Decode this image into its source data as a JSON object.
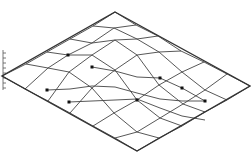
{
  "figure": {
    "kind": "wireframe-surface",
    "colors": {
      "background": "#ffffff",
      "edge": "#333333",
      "mesh": "#444444",
      "marker": "#111111",
      "axis": "#555555"
    }
  },
  "outline": {
    "top": [
      115,
      12
    ],
    "right": [
      250,
      86
    ],
    "bottom": [
      137,
      151
    ],
    "left": [
      2,
      76
    ]
  },
  "axis": {
    "x": 3,
    "y_top": 50,
    "y_bottom": 90,
    "ticks": [
      53,
      58,
      63,
      68,
      73,
      78,
      83,
      88
    ]
  },
  "mesh_rows": [
    [
      [
        2,
        76
      ],
      [
        26,
        64
      ],
      [
        47,
        52
      ],
      [
        70,
        39
      ],
      [
        93,
        26
      ],
      [
        115,
        12
      ]
    ],
    [
      [
        25,
        89
      ],
      [
        48,
        68
      ],
      [
        68,
        55
      ],
      [
        92,
        43
      ],
      [
        114,
        28
      ],
      [
        136,
        25
      ]
    ],
    [
      [
        48,
        101
      ],
      [
        69,
        72
      ],
      [
        92,
        55
      ],
      [
        115,
        40
      ],
      [
        137,
        39
      ],
      [
        158,
        36
      ]
    ],
    [
      [
        70,
        113
      ],
      [
        92,
        88
      ],
      [
        115,
        70
      ],
      [
        137,
        55
      ],
      [
        159,
        52
      ],
      [
        181,
        51
      ]
    ],
    [
      [
        93,
        126
      ],
      [
        114,
        113
      ],
      [
        137,
        100
      ],
      [
        159,
        85
      ],
      [
        182,
        72
      ],
      [
        204,
        62
      ]
    ],
    [
      [
        115,
        138
      ],
      [
        137,
        132
      ],
      [
        160,
        118
      ],
      [
        183,
        104
      ],
      [
        205,
        90
      ],
      [
        227,
        74
      ]
    ],
    [
      [
        137,
        151
      ],
      [
        159,
        138
      ],
      [
        182,
        126
      ],
      [
        205,
        112
      ],
      [
        227,
        100
      ],
      [
        250,
        86
      ]
    ]
  ],
  "markers": [
    [
      68,
      55
    ],
    [
      47,
      90
    ],
    [
      92,
      67
    ],
    [
      69,
      102
    ],
    [
      160,
      78
    ],
    [
      182,
      88
    ],
    [
      205,
      101
    ],
    [
      137,
      100
    ]
  ],
  "extra_lines": [
    [
      [
        69,
        102
      ],
      [
        92,
        101
      ],
      [
        115,
        100
      ],
      [
        137,
        99
      ],
      [
        160,
        108
      ],
      [
        182,
        116
      ],
      [
        205,
        120
      ]
    ],
    [
      [
        47,
        90
      ],
      [
        70,
        89
      ],
      [
        92,
        86
      ],
      [
        115,
        87
      ],
      [
        137,
        93
      ],
      [
        160,
        99
      ],
      [
        182,
        101
      ],
      [
        205,
        101
      ]
    ],
    [
      [
        92,
        67
      ],
      [
        115,
        71
      ],
      [
        137,
        77
      ],
      [
        160,
        78
      ],
      [
        182,
        88
      ],
      [
        205,
        101
      ]
    ]
  ]
}
